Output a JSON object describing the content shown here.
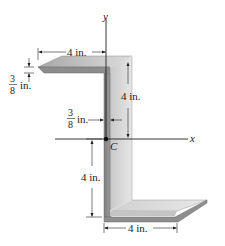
{
  "figure": {
    "axes": {
      "x_label": "x",
      "y_label": "y",
      "centroid_label": "C"
    },
    "dimensions": {
      "top_flange_width": "4 in.",
      "thickness_num": "3",
      "thickness_den": "8",
      "thickness_unit": "in.",
      "upper_height": "4 in.",
      "web_thickness_num": "3",
      "web_thickness_den": "8",
      "web_thickness_unit": "in.",
      "lower_height": "4 in.",
      "bottom_flange_width": "4 in."
    },
    "colors": {
      "face_light": "#d4d4d4",
      "face_mid": "#b8b8b8",
      "face_dark": "#8e8e8e",
      "edge": "#6a6a6a",
      "line": "#222222"
    }
  }
}
